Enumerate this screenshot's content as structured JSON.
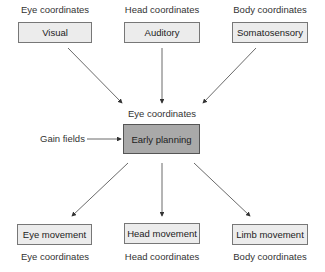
{
  "inputs": [
    {
      "coordinates": "Eye coordinates",
      "label": "Visual"
    },
    {
      "coordinates": "Head coordinates",
      "label": "Auditory"
    },
    {
      "coordinates": "Body coordinates",
      "label": "Somatosensory"
    }
  ],
  "center": {
    "coordinates": "Eye coordinates",
    "label": "Early planning",
    "modulator": "Gain fields"
  },
  "outputs": [
    {
      "label": "Eye movement",
      "coordinates": "Eye coordinates"
    },
    {
      "label": "Head movement",
      "coordinates": "Head coordinates"
    },
    {
      "label": "Limb movement",
      "coordinates": "Body coordinates"
    }
  ]
}
